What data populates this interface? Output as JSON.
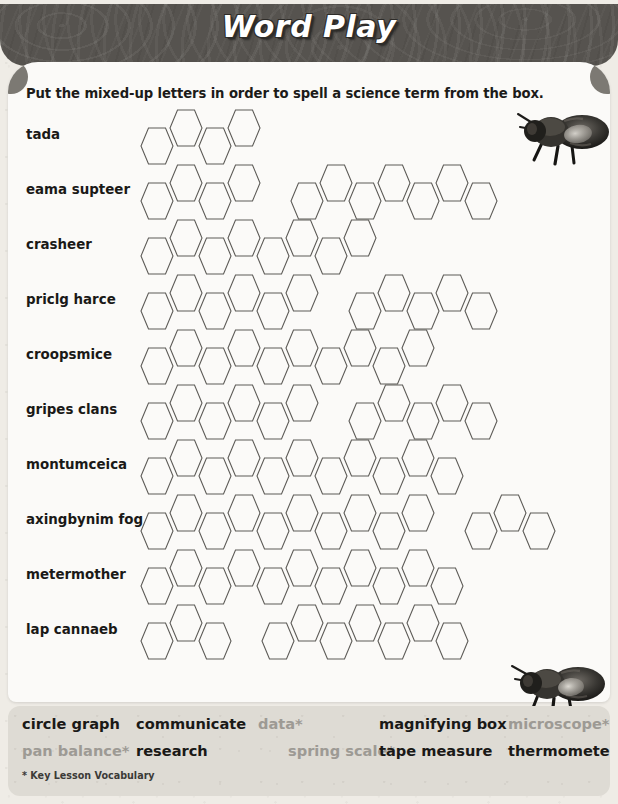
{
  "header": {
    "title": "Word Play"
  },
  "instruction": "Put the mixed-up letters in order to spell a science term from the box.",
  "colors": {
    "header_band": "#57544f",
    "card": "#fbfaf8",
    "page": "#efece6",
    "vocab_box": "#dedbd4",
    "text": "#1a1917",
    "key_vocab_text": "#9d9a94",
    "hex_stroke": "#5d5b57"
  },
  "puzzle": {
    "rows": [
      {
        "label": "tada",
        "groups": [
          4
        ]
      },
      {
        "label": "eama supteer",
        "groups": [
          4,
          7
        ]
      },
      {
        "label": "crasheer",
        "groups": [
          8
        ]
      },
      {
        "label": "priclg harce",
        "groups": [
          6,
          5
        ]
      },
      {
        "label": "croopsmice",
        "groups": [
          10
        ]
      },
      {
        "label": "gripes clans",
        "groups": [
          6,
          5
        ]
      },
      {
        "label": "montumceica",
        "groups": [
          11
        ]
      },
      {
        "label": "axingbynim fog",
        "groups": [
          10,
          3
        ]
      },
      {
        "label": "metermother",
        "groups": [
          11
        ]
      },
      {
        "label": "lap cannaeb",
        "groups": [
          3,
          7
        ]
      }
    ]
  },
  "vocabulary": {
    "row1": [
      {
        "text": "circle graph",
        "key": false,
        "left": 14
      },
      {
        "text": "communicate",
        "key": false,
        "left": 128
      },
      {
        "text": "data*",
        "key": true,
        "left": 250
      },
      {
        "text": "magnifying box",
        "key": false,
        "left": 371
      },
      {
        "text": "microscope*",
        "key": true,
        "left": 500
      }
    ],
    "row2": [
      {
        "text": "pan balance*",
        "key": true,
        "left": 14
      },
      {
        "text": "research",
        "key": false,
        "left": 128
      },
      {
        "text": "spring scale*",
        "key": true,
        "left": 280
      },
      {
        "text": "tape measure",
        "key": false,
        "left": 371
      },
      {
        "text": "thermometer",
        "key": false,
        "left": 500
      }
    ],
    "footnote": "* Key Lesson Vocabulary"
  },
  "decorations": {
    "bee_top": "bee-illustration",
    "bee_bottom": "bee-illustration"
  }
}
